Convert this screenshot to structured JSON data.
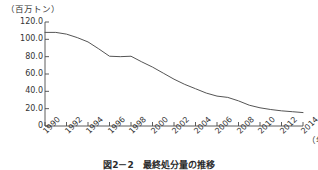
{
  "chart_data": {
    "type": "line",
    "title": "",
    "caption": "図2－2　最終処分量の推移",
    "ylabel": "（百万トン）",
    "xlabel": "（年）",
    "ylim": [
      0,
      120
    ],
    "xlim": [
      1990,
      2014
    ],
    "grid": false,
    "legend": false,
    "y_ticks": [
      "0",
      "20.0",
      "40.0",
      "60.0",
      "80.0",
      "100.0",
      "120.0"
    ],
    "y_tick_values": [
      0,
      20,
      40,
      60,
      80,
      100,
      120
    ],
    "x_ticks": [
      "1990",
      "1992",
      "1994",
      "1996",
      "1998",
      "2000",
      "2002",
      "2004",
      "2006",
      "2008",
      "2010",
      "2012",
      "2014"
    ],
    "x_tick_values": [
      1990,
      1992,
      1994,
      1996,
      1998,
      2000,
      2002,
      2004,
      2006,
      2008,
      2010,
      2012,
      2014
    ],
    "series": [
      {
        "name": "最終処分量",
        "color": "#555555",
        "x": [
          1990,
          1991,
          1992,
          1993,
          1994,
          1995,
          1996,
          1997,
          1998,
          1999,
          2000,
          2001,
          2002,
          2003,
          2004,
          2005,
          2006,
          2007,
          2008,
          2009,
          2010,
          2011,
          2012,
          2013,
          2014
        ],
        "values": [
          108.0,
          108.0,
          106.0,
          102.0,
          97.0,
          89.0,
          80.5,
          80.0,
          80.5,
          74.0,
          68.0,
          61.0,
          54.0,
          48.0,
          43.0,
          38.0,
          34.5,
          33.0,
          29.0,
          24.0,
          21.0,
          19.0,
          17.5,
          16.5,
          15.5
        ]
      }
    ]
  },
  "colors": {
    "line": "#555555",
    "axis": "#4a4a4a",
    "text": "#333333"
  }
}
